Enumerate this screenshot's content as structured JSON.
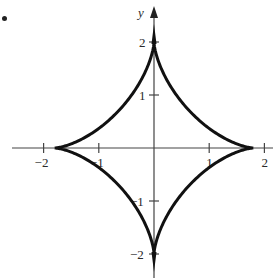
{
  "figure": {
    "bullet": "•",
    "axis_label_y": "y",
    "x_ticks": [
      {
        "value": -2,
        "label": "−2"
      },
      {
        "value": -1,
        "label": "−1"
      },
      {
        "value": 1,
        "label": "1"
      },
      {
        "value": 2,
        "label": "2"
      }
    ],
    "y_ticks": [
      {
        "value": 2,
        "label": "2"
      },
      {
        "value": 1,
        "label": "1"
      },
      {
        "value": -1,
        "label": "−1"
      },
      {
        "value": -2,
        "label": "−2"
      }
    ],
    "colors": {
      "curve": "#111111",
      "axis": "#444444",
      "background": "#ffffff"
    }
  },
  "chart_data": {
    "type": "line",
    "title": "",
    "xlabel": "",
    "ylabel": "y",
    "xlim": [
      -2.1,
      2.1
    ],
    "ylim": [
      -2.2,
      2.3
    ],
    "grid": false,
    "legend": null,
    "x_tick_labels": [
      "-2",
      "-1",
      "1",
      "2"
    ],
    "y_tick_labels": [
      "2",
      "1",
      "-1",
      "-2"
    ],
    "series": [
      {
        "name": "astroid-like curve",
        "parametric": "x = 1.8 cos^3 t, y = 2 sin^3 t",
        "cusps": [
          [
            1.8,
            0
          ],
          [
            0,
            2
          ],
          [
            -1.8,
            0
          ],
          [
            0,
            -2
          ]
        ],
        "x": [
          1.8,
          1.27,
          0.64,
          0.23,
          0.0,
          -0.23,
          -0.64,
          -1.27,
          -1.8,
          -1.27,
          -0.64,
          -0.23,
          0.0,
          0.23,
          0.64,
          1.27,
          1.8
        ],
        "y": [
          0.0,
          0.05,
          0.35,
          0.95,
          2.0,
          0.95,
          0.35,
          0.05,
          0.0,
          -0.05,
          -0.35,
          -0.95,
          -2.0,
          -0.95,
          -0.35,
          -0.05,
          0.0
        ]
      }
    ]
  }
}
